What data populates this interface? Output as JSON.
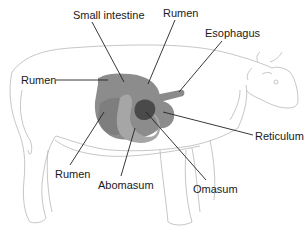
{
  "diagram": {
    "labels": [
      {
        "id": "small-intestine",
        "text": "Small intestine",
        "x": 73,
        "y": 9
      },
      {
        "id": "rumen-top",
        "text": "Rumen",
        "x": 163,
        "y": 7
      },
      {
        "id": "esophagus",
        "text": "Esophagus",
        "x": 205,
        "y": 27
      },
      {
        "id": "rumen-left",
        "text": "Rumen",
        "x": 21,
        "y": 74
      },
      {
        "id": "reticulum",
        "text": "Reticulum",
        "x": 255,
        "y": 130
      },
      {
        "id": "rumen-bottom",
        "text": "Rumen",
        "x": 55,
        "y": 168
      },
      {
        "id": "abomasum",
        "text": "Abomasum",
        "x": 98,
        "y": 179
      },
      {
        "id": "omasum",
        "text": "Omasum",
        "x": 193,
        "y": 183
      }
    ],
    "colors": {
      "outline": "#b8b8b8",
      "rumen": "#8c8c8c",
      "rumen_dark": "#7a7a7a",
      "abomasum": "#a6a6a6",
      "omasum": "#4a4a4a",
      "esophagus": "#8a8a8a",
      "leader": "#222222",
      "text": "#1a1a1a"
    }
  }
}
